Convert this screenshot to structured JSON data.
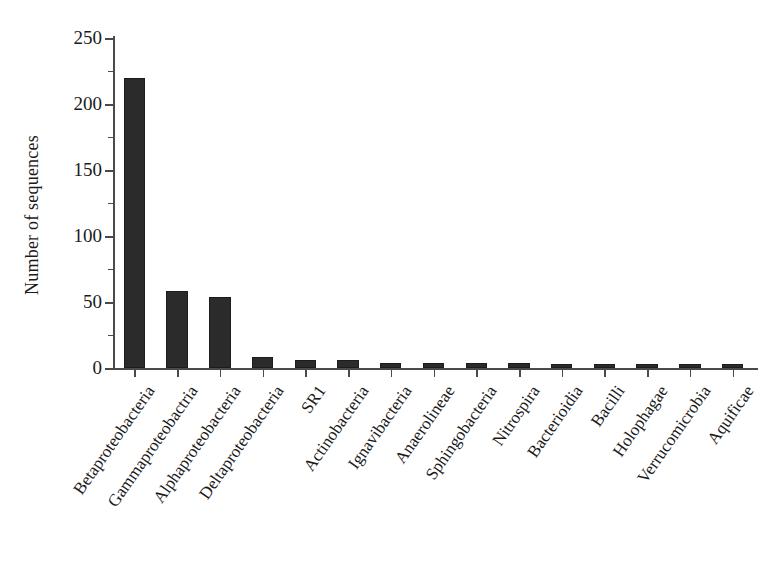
{
  "chart_data": {
    "type": "bar",
    "title": "",
    "subtitle": "",
    "xlabel": "",
    "ylabel": "Number of sequences",
    "ylim": [
      0,
      250
    ],
    "y_major_ticks": [
      0,
      50,
      100,
      150,
      200,
      250
    ],
    "y_minor_ticks": [
      25,
      75,
      125,
      175,
      225
    ],
    "grid": false,
    "legend": null,
    "bar_color": "#2b2b2b",
    "axis_color": "#4a4a4a",
    "background_color": "#ffffff",
    "categories": [
      "Betaproteobacteria",
      "Gammaproteobactria",
      "Alphaproteobacteria",
      "Deltaproteobacteria",
      "SR1",
      "Actinobacteria",
      "Ignavibacteria",
      "Anaerolineae",
      "Sphingobacteria",
      "Nitrospira",
      "Bacterioidia",
      "Bacilli",
      "Holophagae",
      "Verrucomicrobia",
      "Aquificae"
    ],
    "values": [
      220,
      58,
      54,
      8,
      6,
      6,
      4,
      4,
      4,
      4,
      3,
      3,
      3,
      3,
      3
    ]
  }
}
